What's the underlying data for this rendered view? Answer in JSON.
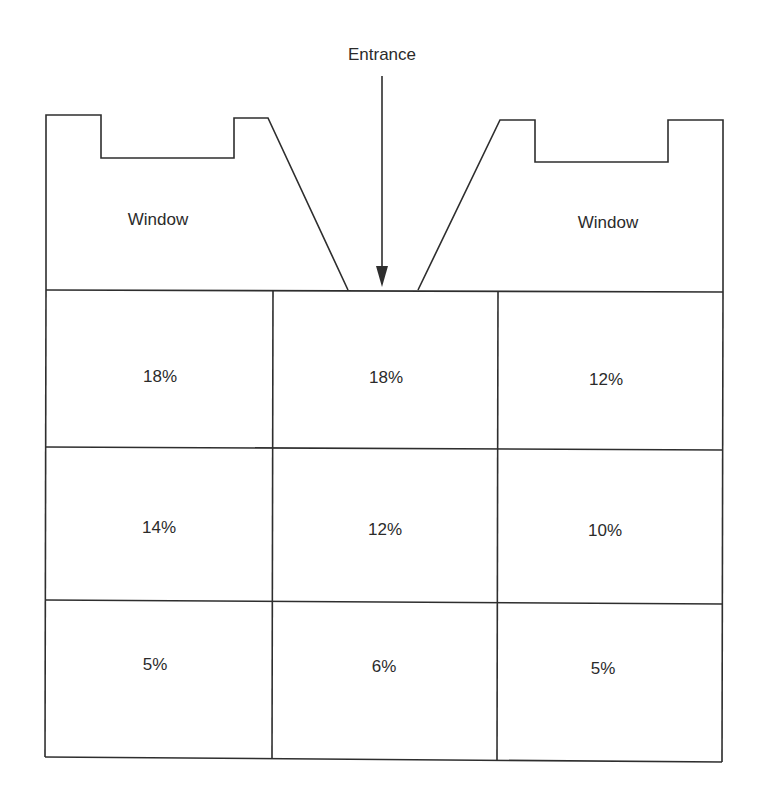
{
  "diagram": {
    "type": "floor-plan",
    "entrance_label": "Entrance",
    "window_left_label": "Window",
    "window_right_label": "Window",
    "line_color": "#2e2e2e",
    "grid": {
      "rows": 3,
      "cols": 3,
      "cells": [
        [
          "18%",
          "18%",
          "12%"
        ],
        [
          "14%",
          "12%",
          "10%"
        ],
        [
          "5%",
          "6%",
          "5%"
        ]
      ]
    }
  }
}
